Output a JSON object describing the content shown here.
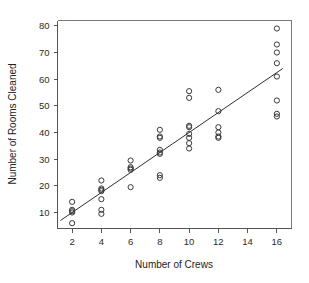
{
  "chart_data": {
    "type": "scatter",
    "title": "",
    "xlabel": "Number of Crews",
    "ylabel": "Number of Rooms Cleaned",
    "xlim": [
      1,
      17
    ],
    "ylim": [
      4,
      82
    ],
    "xticks": [
      2,
      4,
      6,
      8,
      10,
      12,
      14,
      16
    ],
    "xtick_labels": [
      "2",
      "4",
      "6",
      "8",
      "10",
      "12",
      "14",
      "16"
    ],
    "yticks": [
      10,
      20,
      30,
      40,
      50,
      60,
      70,
      80
    ],
    "ytick_labels": [
      "10",
      "20",
      "30",
      "40",
      "50",
      "60",
      "70",
      "80"
    ],
    "grid": false,
    "legend": null,
    "marker": "open-circle",
    "point_color": "#3a3a3a",
    "line_color": "#2e2e2e",
    "axis_color": "#555555",
    "background": "#ffffff",
    "series": [
      {
        "name": "Rooms cleaned",
        "x": [
          2,
          2,
          2,
          2,
          2,
          4,
          4,
          4,
          4,
          4,
          4,
          4,
          6,
          6,
          6,
          6,
          6,
          8,
          8,
          8,
          8,
          8,
          8,
          8,
          8,
          10,
          10,
          10,
          10,
          10,
          10,
          10,
          10,
          12,
          12,
          12,
          12,
          12,
          12,
          16,
          16,
          16,
          16,
          16,
          16,
          16,
          16
        ],
        "y": [
          14,
          11,
          10.5,
          10,
          6,
          22,
          19,
          18.5,
          18,
          15,
          11,
          9.5,
          29.5,
          27,
          26.5,
          26,
          19.5,
          41,
          38.5,
          38,
          33.5,
          32.5,
          32,
          24,
          23,
          55.5,
          53,
          42.5,
          42,
          39.5,
          38,
          36,
          34,
          56,
          48,
          42,
          40,
          38.5,
          38,
          79,
          73,
          70,
          66,
          61,
          52,
          47,
          46
        ]
      }
    ],
    "fit_line": {
      "type": "linear-regression",
      "x_start": 1.2,
      "y_start": 7.0,
      "x_end": 16.4,
      "y_end": 64.0
    }
  },
  "axes": {
    "x_title": "Number of Crews",
    "y_title": "Number of Rooms Cleaned"
  }
}
